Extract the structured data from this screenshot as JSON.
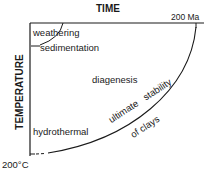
{
  "diagram": {
    "x_axis": {
      "title": "TIME",
      "end_label": "200 Ma"
    },
    "y_axis": {
      "title": "TEMPERATURE",
      "end_label": "200°C"
    },
    "regions": {
      "weathering": "weathering",
      "sedimentation": "sedimentation",
      "diagenesis": "diagenesis",
      "hydrothermal": "hydrothermal"
    },
    "boundary": {
      "label_line1": "ultimate   stability",
      "label_line2": "of clays"
    },
    "colors": {
      "line": "#1a1a1a",
      "background": "#ffffff"
    }
  }
}
